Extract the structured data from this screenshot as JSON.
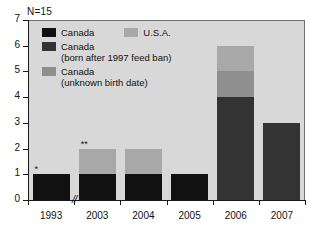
{
  "annotation": {
    "sample_count": "N=15"
  },
  "legend": {
    "position": "inside-top-left",
    "entries": [
      {
        "label": "Canada",
        "sublabel": "",
        "color": "#111111"
      },
      {
        "label": "U.S.A.",
        "sublabel": "",
        "color": "#a8a8a8"
      },
      {
        "label": "Canada",
        "sublabel": "(born after 1997 feed ban)",
        "color": "#333333"
      },
      {
        "label": "Canada",
        "sublabel": "(unknown birth date)",
        "color": "#8f8f8f"
      }
    ]
  },
  "chart_data": {
    "type": "bar",
    "title": "",
    "subtitle": "",
    "xlabel": "",
    "ylabel": "",
    "stacked": true,
    "grid": false,
    "legend_position": "inside-top-left",
    "categories": [
      "1993",
      "2003",
      "2004",
      "2005",
      "2006",
      "2007"
    ],
    "ylim": [
      0,
      7
    ],
    "yticks": [
      "0",
      "1",
      "2",
      "3",
      "4",
      "5",
      "6",
      "7"
    ],
    "axis_break": "//",
    "axis_break_after_category": "1993",
    "series": [
      {
        "name": "Canada",
        "color": "#111111",
        "values": [
          1,
          1,
          1,
          1,
          0,
          0
        ]
      },
      {
        "name": "Canada (born after 1997 feed ban)",
        "color": "#333333",
        "values": [
          0,
          0,
          0,
          0,
          4,
          3
        ]
      },
      {
        "name": "Canada (unknown birth date)",
        "color": "#8f8f8f",
        "values": [
          0,
          0,
          0,
          0,
          1,
          0
        ]
      },
      {
        "name": "U.S.A.",
        "color": "#a8a8a8",
        "values": [
          0,
          1,
          1,
          0,
          1,
          0
        ]
      }
    ],
    "totals": [
      1,
      2,
      2,
      1,
      6,
      3
    ],
    "annotations": [
      {
        "category": "1993",
        "text": "*",
        "value": 1
      },
      {
        "category": "2003",
        "text": "**",
        "value": 2
      }
    ]
  }
}
